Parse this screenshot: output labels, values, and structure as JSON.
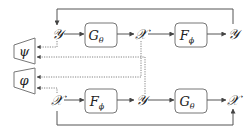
{
  "diagram": {
    "type": "cycle-consistency-diagram",
    "colors": {
      "stroke": "#555555",
      "box_stroke": "#777777",
      "text": "#222222",
      "background": "#ffffff"
    },
    "top_row": {
      "start": "𝒴",
      "box1": {
        "main": "G",
        "sub": "θ"
      },
      "middle": "𝒳",
      "box2": {
        "main": "F",
        "sub": "ϕ"
      },
      "end": "𝒴"
    },
    "bottom_row": {
      "start": "𝒳",
      "box1": {
        "main": "F",
        "sub": "ϕ"
      },
      "middle": "𝒴",
      "box2": {
        "main": "G",
        "sub": "θ"
      },
      "end": "𝒳"
    },
    "discriminators": {
      "upper": "ψ",
      "lower": "φ"
    }
  }
}
